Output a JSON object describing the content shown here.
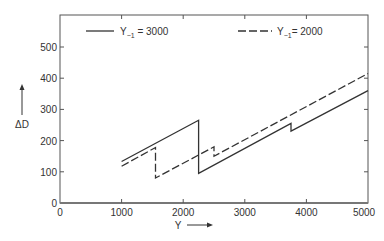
{
  "chart_data": {
    "type": "line",
    "title": "",
    "xlabel": "Y",
    "ylabel": "ΔD",
    "xlim": [
      0,
      5000
    ],
    "ylim": [
      0,
      600
    ],
    "xticks": [
      0,
      1000,
      2000,
      3000,
      4000,
      5000
    ],
    "yticks": [
      0,
      100,
      200,
      300,
      400,
      500
    ],
    "xtick_labels": [
      "0",
      "1000",
      "2000",
      "3000",
      "4000",
      "5000"
    ],
    "ytick_labels": [
      "0",
      "100",
      "200",
      "300",
      "400",
      "500"
    ],
    "grid": false,
    "legend_position": "top",
    "series": [
      {
        "name": "Y_{-1} = 3000",
        "style": "solid",
        "points": [
          [
            1000,
            133
          ],
          [
            2250,
            265
          ],
          [
            2250,
            95
          ],
          [
            3750,
            255
          ],
          [
            3750,
            230
          ],
          [
            5000,
            360
          ]
        ]
      },
      {
        "name": "Y_{-1} = 2000",
        "style": "dashed",
        "points": [
          [
            1000,
            118
          ],
          [
            1550,
            178
          ],
          [
            1550,
            80
          ],
          [
            2500,
            180
          ],
          [
            2500,
            150
          ],
          [
            5000,
            415
          ]
        ]
      }
    ]
  },
  "legend": {
    "solid_label_prefix": "Y",
    "solid_label_sub": "−1",
    "solid_label_value": " = 3000",
    "dashed_label_prefix": "Y",
    "dashed_label_sub": "−1",
    "dashed_label_value": "= 2000"
  },
  "axes": {
    "x_label": "Y",
    "y_label": "ΔD",
    "x_ticks": [
      "0",
      "1000",
      "2000",
      "3000",
      "4000",
      "5000"
    ],
    "y_ticks": [
      "0",
      "100",
      "200",
      "300",
      "400",
      "500"
    ]
  }
}
